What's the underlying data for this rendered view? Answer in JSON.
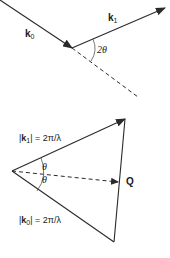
{
  "diagram": {
    "top": {
      "incident_vector": {
        "symbol": "k",
        "subscript": "0"
      },
      "scattered_vector": {
        "symbol": "k",
        "subscript": "1"
      },
      "scattering_angle_label": "2θ"
    },
    "bottom": {
      "k1_magnitude": {
        "prefix": "|",
        "symbol": "k",
        "subscript": "1",
        "suffix": "| = 2π/λ"
      },
      "k0_magnitude": {
        "prefix": "|",
        "symbol": "k",
        "subscript": "0",
        "suffix": "| = 2π/λ"
      },
      "upper_half_angle": "θ",
      "lower_half_angle": "θ",
      "scattering_vector_label": "Q"
    },
    "colors": {
      "line": "#2a2a2a",
      "text": "#1a1a1a",
      "background": "#ffffff"
    }
  }
}
